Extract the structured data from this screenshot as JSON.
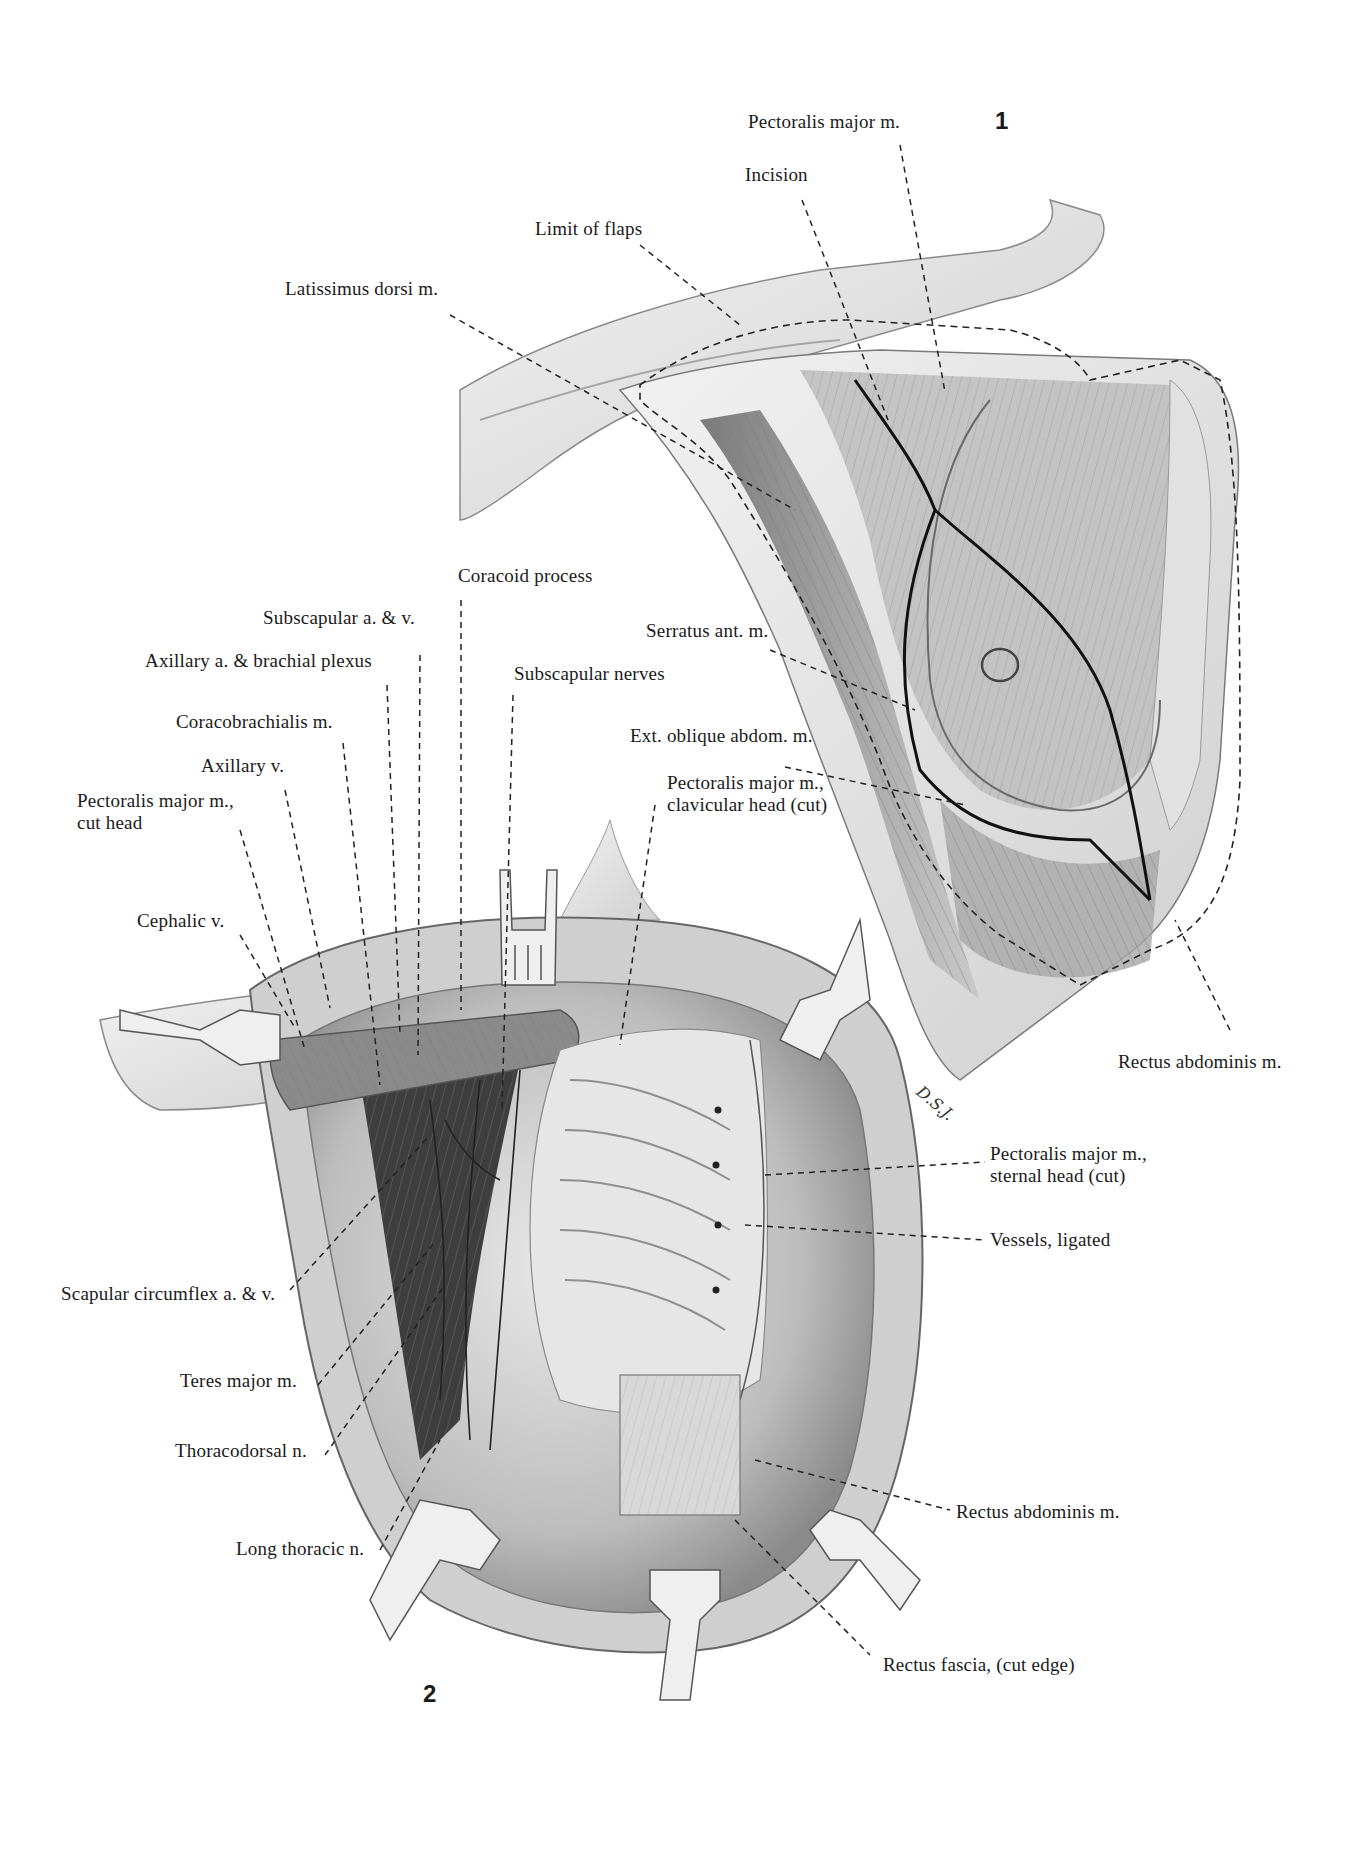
{
  "figures": [
    {
      "number": "1",
      "caption": "Breast with incision and limit of flaps, anterior chest"
    },
    {
      "number": "2",
      "caption": "Exposed axilla and chest wall after mastectomy with retractors"
    }
  ],
  "signature": "D.S.J.",
  "labels": {
    "fig1": {
      "pectoralis_major": "Pectoralis major m.",
      "incision": "Incision",
      "limit_of_flaps": "Limit of flaps",
      "latissimus_dorsi": "Latissimus dorsi m.",
      "serratus_ant": "Serratus ant. m.",
      "ext_oblique": "Ext. oblique abdom. m.",
      "rectus_abdominis": "Rectus abdominis m."
    },
    "fig2": {
      "coracoid_process": "Coracoid process",
      "subscapular_av": "Subscapular a. & v.",
      "axillary_plexus": "Axillary a. & brachial  plexus",
      "subscapular_nerves": "Subscapular nerves",
      "coracobrachialis": "Coracobrachialis m.",
      "axillary_v": "Axillary v.",
      "pec_cut_head_1": "Pectoralis major m.,",
      "pec_cut_head_2": "cut head",
      "pec_clav_1": "Pectoralis major m.,",
      "pec_clav_2": "clavicular  head (cut)",
      "cephalic_v": "Cephalic v.",
      "pec_sternal_1": "Pectoralis major m.,",
      "pec_sternal_2": "sternal head    (cut)",
      "vessels_ligated": "Vessels, ligated",
      "scapular_circumflex": "Scapular circumflex  a. & v.",
      "teres_major": "Teres major m.",
      "thoracodorsal": "Thoracodorsal n.",
      "long_thoracic": "Long thoracic n.",
      "rectus_abdominis": "Rectus abdominis m.",
      "rectus_fascia": "Rectus fascia, (cut edge)"
    }
  },
  "colors": {
    "ink": "#1a1a1a",
    "shade_dark": "#555555",
    "shade_mid": "#9a9a9a",
    "shade_light": "#d6d6d6",
    "background": "#ffffff"
  }
}
